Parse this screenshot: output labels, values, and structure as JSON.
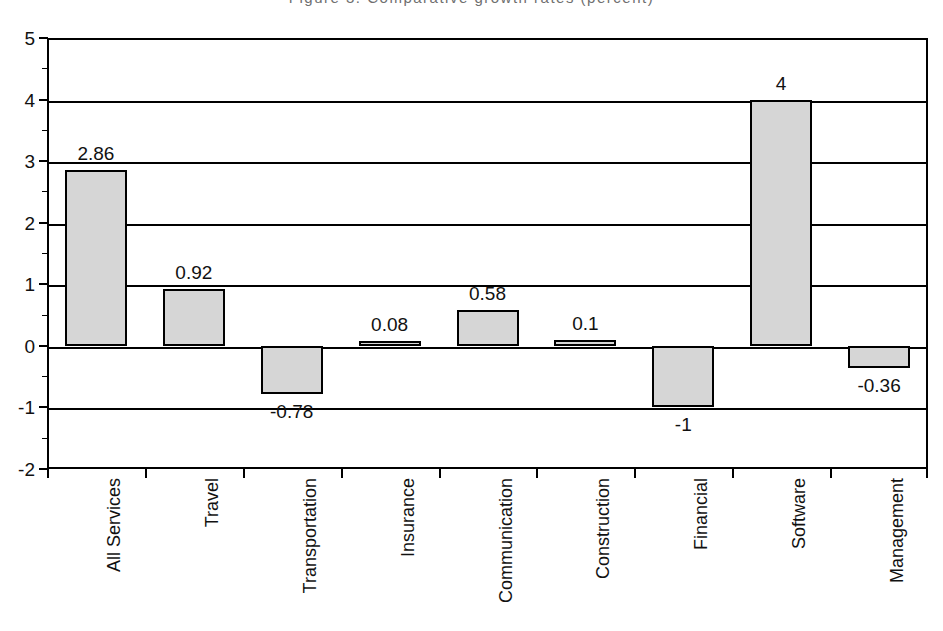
{
  "title_strip": "Figure 3. Comparative growth rates (percent)",
  "chart_data": {
    "type": "bar",
    "title": "",
    "subtitle": "",
    "xlabel": "",
    "ylabel": "",
    "ylim": [
      -2,
      5
    ],
    "yticks": [
      5,
      4,
      3,
      2,
      1,
      0,
      -1,
      -2
    ],
    "ytick_labels": [
      "5",
      "4",
      "3",
      "2",
      "1",
      "0",
      "-1",
      "-2"
    ],
    "grid": true,
    "legend": "none",
    "orientation": "vertical",
    "bar_fill_color": "#d6d6d6",
    "bar_edge_color": "#000000",
    "categories": [
      "All Services",
      "Travel",
      "Transportation",
      "Insurance",
      "Communication",
      "Construction",
      "Financial",
      "Software",
      "Management"
    ],
    "values": [
      2.86,
      0.92,
      -0.78,
      0.08,
      0.58,
      0.1,
      -1,
      4,
      -0.36
    ],
    "value_labels": [
      "2.86",
      "0.92",
      "-0.78",
      "0.08",
      "0.58",
      "0.1",
      "-1",
      "4",
      "-0.36"
    ]
  }
}
